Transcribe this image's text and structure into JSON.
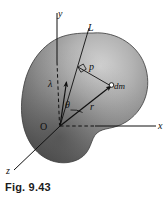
{
  "figure": {
    "caption": "Fig. 9.43",
    "axes": {
      "y_label": "y",
      "x_label": "x",
      "z_label": "z"
    },
    "annotations": {
      "line_label": "L",
      "perp_distance_label": "p",
      "mass_element_label": "dm",
      "unit_vector_label": "λ",
      "angle_label": "θ",
      "radius_label": "r",
      "origin_label": "O"
    },
    "colors": {
      "body_light": "#c9c9c9",
      "body_mid": "#9a9a9a",
      "body_dark": "#4e4e4e",
      "ink": "#101010",
      "background": "#ffffff"
    }
  }
}
